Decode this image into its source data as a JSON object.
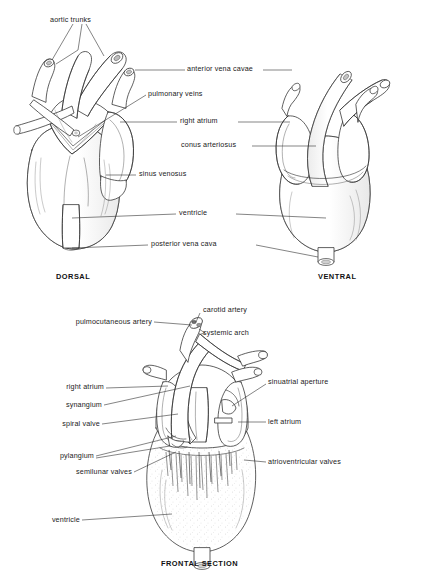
{
  "figure": {
    "title_dorsal": "DORSAL",
    "title_ventral": "VENTRAL",
    "title_frontal": "FRONTAL SECTION",
    "ink_color": "#2b2b2b",
    "leader_color": "#333333",
    "background": "#ffffff"
  },
  "top_panel": {
    "labels": {
      "aortic_trunks": "aortic trunks",
      "anterior_vena_cavae": "anterior vena cavae",
      "pulmonary_veins": "pulmonary veins",
      "right_atrium": "right atrium",
      "conus_arteriosus": "conus arteriosus",
      "sinus_venosus": "sinus venosus",
      "ventricle": "ventricle",
      "posterior_vena_cava": "posterior vena cava"
    }
  },
  "bottom_panel": {
    "labels": {
      "carotid_artery": "carotid artery",
      "systemic_arch": "systemic arch",
      "pulmocutaneous_artery": "pulmocutaneous artery",
      "right_atrium": "right atrium",
      "synangium": "synangium",
      "spiral_valve": "spiral valve",
      "pylangium": "pylangium",
      "semilunar_valves": "semilunar valves",
      "ventricle": "ventricle",
      "sinuatrial_aperture": "sinuatrial aperture",
      "left_atrium": "left atrium",
      "atrioventricular_valves": "atrioventricular valves"
    }
  }
}
